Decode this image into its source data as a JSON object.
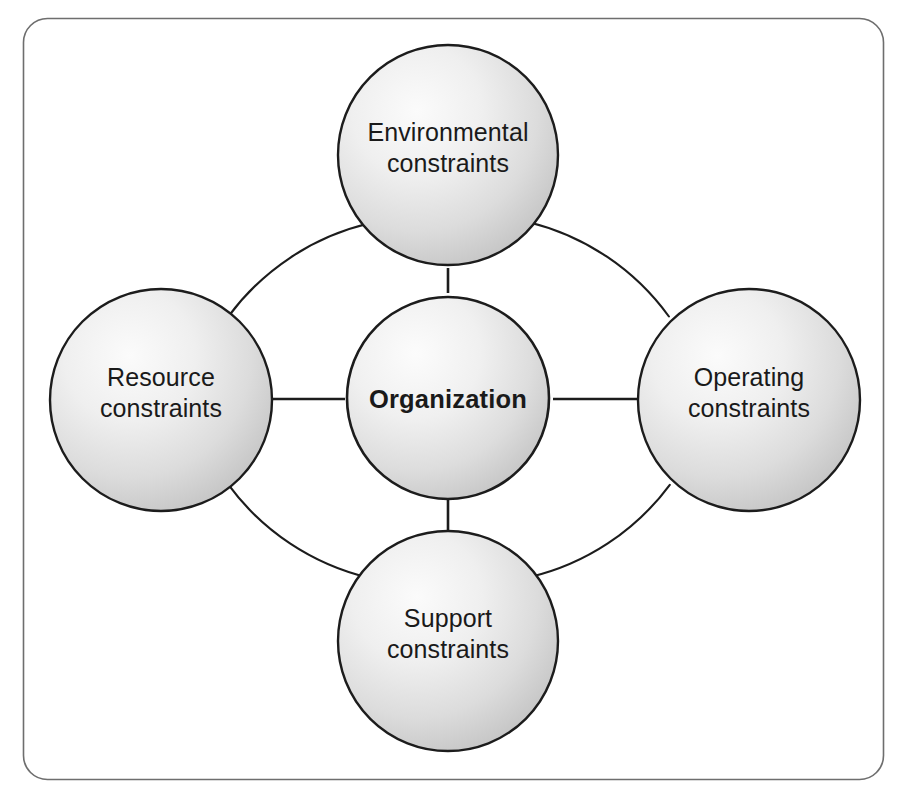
{
  "diagram": {
    "type": "hub-and-spoke",
    "frame": {
      "name": "outer-frame",
      "shape": "rounded-rectangle",
      "stroke_color": "#6e6e6e",
      "fill_color": "#ffffff",
      "corner_radius": 24
    },
    "style": {
      "node_stroke_color": "#1c1c1c",
      "node_fill_light": "#f4f4f4",
      "node_fill_dark": "#bfbfbf",
      "connector_color": "#1c1c1c",
      "arc_color": "#1c1c1c",
      "text_color": "#1a1a1a"
    },
    "center_node": {
      "id": "organization",
      "label": "Organization",
      "emphasis": "bold",
      "cx": 448,
      "cy": 398,
      "r": 101
    },
    "satellite_nodes": [
      {
        "id": "environmental-constraints",
        "label": "Environmental\nconstraints",
        "position": "top",
        "cx": 448,
        "cy": 155,
        "r": 110
      },
      {
        "id": "operating-constraints",
        "label": "Operating\nconstraints",
        "position": "right",
        "cx": 749,
        "cy": 400,
        "r": 111
      },
      {
        "id": "support-constraints",
        "label": "Support\nconstraints",
        "position": "bottom",
        "cx": 448,
        "cy": 641,
        "r": 110
      },
      {
        "id": "resource-constraints",
        "label": "Resource\nconstraints",
        "position": "left",
        "cx": 161,
        "cy": 400,
        "r": 111
      }
    ],
    "spokes": [
      {
        "id": "spoke-center-to-top",
        "from": "organization",
        "to": "environmental-constraints"
      },
      {
        "id": "spoke-center-to-right",
        "from": "organization",
        "to": "operating-constraints"
      },
      {
        "id": "spoke-center-to-bottom",
        "from": "organization",
        "to": "support-constraints"
      },
      {
        "id": "spoke-center-to-left",
        "from": "organization",
        "to": "resource-constraints"
      }
    ],
    "arcs": [
      {
        "id": "arc-top-left",
        "from": "environmental-constraints",
        "to": "resource-constraints"
      },
      {
        "id": "arc-top-right",
        "from": "environmental-constraints",
        "to": "operating-constraints"
      },
      {
        "id": "arc-bottom-right",
        "from": "operating-constraints",
        "to": "support-constraints"
      },
      {
        "id": "arc-bottom-left",
        "from": "support-constraints",
        "to": "resource-constraints"
      }
    ]
  }
}
